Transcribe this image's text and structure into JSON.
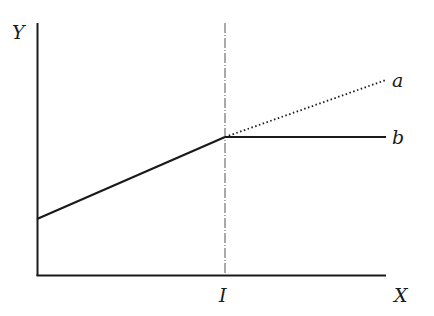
{
  "diagram": {
    "axes": {
      "y_label": "Y",
      "x_label": "X",
      "threshold_label": "I"
    },
    "lines": [
      {
        "name": "a",
        "label": "a",
        "style": "dotted",
        "description": "continuation of rising line beyond I"
      },
      {
        "name": "b",
        "label": "b",
        "style": "solid",
        "description": "rising line that levels off at I"
      }
    ],
    "colors": {
      "line": "#1a1a1a",
      "guide": "#555555",
      "background": "#ffffff"
    }
  }
}
